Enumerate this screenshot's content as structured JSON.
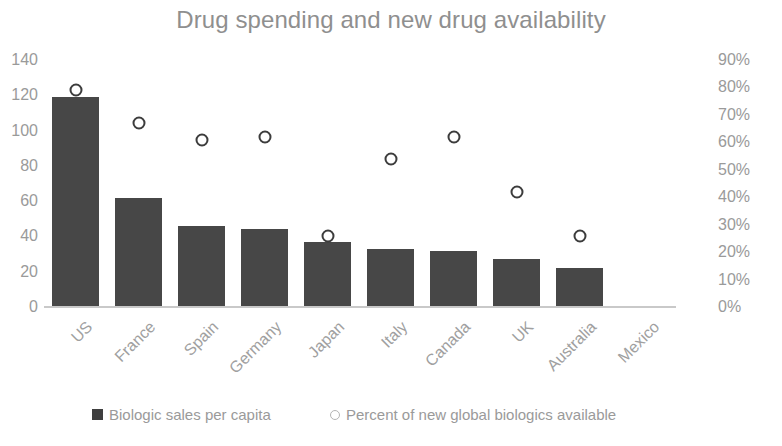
{
  "chart_data": {
    "type": "bar",
    "title": "Drug spending and new drug availability",
    "xlabel": "",
    "ylabel": "",
    "grid": false,
    "legend_position": "bottom",
    "categories": [
      "US",
      "France",
      "Spain",
      "Germany",
      "Japan",
      "Italy",
      "Canada",
      "UK",
      "Australia",
      "Mexico"
    ],
    "y_axis_left": {
      "label": "",
      "ylim": [
        0,
        140
      ],
      "ticks": [
        0,
        20,
        40,
        60,
        80,
        100,
        120,
        140
      ],
      "tick_labels": [
        "0",
        "20",
        "40",
        "60",
        "80",
        "100",
        "120",
        "140"
      ]
    },
    "y_axis_right": {
      "label": "",
      "ylim": [
        0,
        90
      ],
      "ticks": [
        0,
        10,
        20,
        30,
        40,
        50,
        60,
        70,
        80,
        90
      ],
      "tick_labels": [
        "0%",
        "10%",
        "20%",
        "30%",
        "40%",
        "50%",
        "60%",
        "70%",
        "80%",
        "90%"
      ]
    },
    "series": [
      {
        "name": "Biologic sales per capita",
        "type": "bar",
        "axis": "left",
        "color": "#474747",
        "values": [
          119,
          62,
          46,
          44,
          37,
          33,
          32,
          27,
          22,
          null
        ]
      },
      {
        "name": "Percent of new global biologics available",
        "type": "scatter",
        "axis": "right",
        "marker": "open-circle",
        "color": "#3c3c3c",
        "values": [
          79,
          67,
          61,
          62,
          26,
          54,
          62,
          42,
          26,
          null
        ]
      }
    ]
  },
  "legend": {
    "items": [
      {
        "label": "Biologic sales per capita",
        "swatch": "filled-square"
      },
      {
        "label": "Percent of new global biologics available",
        "swatch": "open-circle"
      }
    ]
  }
}
